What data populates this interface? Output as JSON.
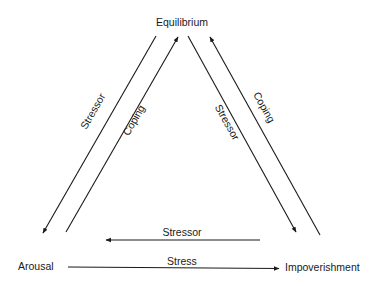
{
  "diagram": {
    "nodes": {
      "top": "Equilibrium",
      "left": "Arousal",
      "right": "Impoverishment"
    },
    "edges": [
      {
        "id": "left-outer",
        "label": "Stressor",
        "from": "Equilibrium",
        "to": "Arousal"
      },
      {
        "id": "left-inner",
        "label": "Coping",
        "from": "Arousal",
        "to": "Equilibrium"
      },
      {
        "id": "right-inner",
        "label": "Stressor",
        "from": "Equilibrium",
        "to": "Impoverishment"
      },
      {
        "id": "right-outer",
        "label": "Coping",
        "from": "Impoverishment",
        "to": "Equilibrium"
      },
      {
        "id": "bottom-upper",
        "label": "Stressor",
        "from": "Impoverishment",
        "to": "Arousal"
      },
      {
        "id": "bottom-lower",
        "label": "Stress",
        "from": "Arousal",
        "to": "Impoverishment"
      }
    ],
    "colors": {
      "ink": "#1a1a1a",
      "background": "#ffffff"
    }
  }
}
